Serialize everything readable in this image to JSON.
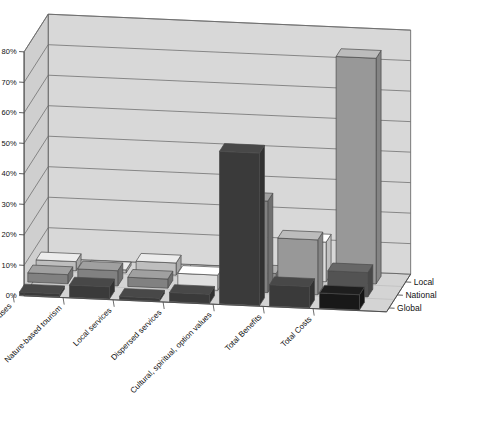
{
  "chart_data": {
    "type": "bar",
    "render": "3d-grouped-bar",
    "title": "",
    "subtitle": "",
    "xlabel": "",
    "ylabel": "",
    "zlabel": "",
    "grid": true,
    "legend_position": "right-axis",
    "ylim": [
      0,
      80
    ],
    "ytick_labels": [
      "0%",
      "10%",
      "20%",
      "30%",
      "40%",
      "50%",
      "60%",
      "70%",
      "80%"
    ],
    "ytick_values": [
      0,
      10,
      20,
      30,
      40,
      50,
      60,
      70,
      80
    ],
    "categories": [
      "Consumptive uses",
      "Nature-based tourism",
      "Local services",
      "Dispersed services",
      "Cultural, spiritual, option values",
      "Total Benefits",
      "Total Costs"
    ],
    "series": [
      {
        "name": "Global",
        "color": "#3f3f3f",
        "values": [
          1,
          4,
          1,
          3,
          50,
          7,
          5
        ]
      },
      {
        "name": "National",
        "color": "#8c8c8c",
        "values": [
          3,
          5,
          3,
          5,
          30,
          18,
          8
        ]
      },
      {
        "name": "Local",
        "color": "#cfcfcf",
        "values": [
          3,
          1,
          4,
          1,
          2,
          13,
          74
        ]
      }
    ],
    "series_names": [
      "Global",
      "National",
      "Local"
    ],
    "colors": {
      "global": "#3f3f3f",
      "national": "#8c8c8c",
      "local": "#cfcfcf",
      "black_bar": "#1a1a1a",
      "wall_back": "#d8d8d8",
      "wall_left": "#cfcfcf",
      "floor": "#d4d4d4",
      "grid_line": "#6b6b6b",
      "edge": "#4a4a4a",
      "text": "#111111"
    },
    "cell_overrides": [
      {
        "category": "Total Costs",
        "series": "Global",
        "color": "#1a1a1a"
      },
      {
        "category": "Total Costs",
        "series": "National",
        "color": "#5a5a5a"
      },
      {
        "category": "Total Costs",
        "series": "Local",
        "color": "#a5a5a5"
      },
      {
        "category": "Total Benefits",
        "series": "National",
        "color": "#a5a5a5"
      },
      {
        "category": "Total Benefits",
        "series": "Local",
        "color": "#f0f0f0"
      },
      {
        "category": "Cultural, spiritual, option values",
        "series": "Local",
        "color": "#9a9a9a"
      },
      {
        "category": "Dispersed services",
        "series": "National",
        "color": "#f2f2f2"
      }
    ]
  }
}
